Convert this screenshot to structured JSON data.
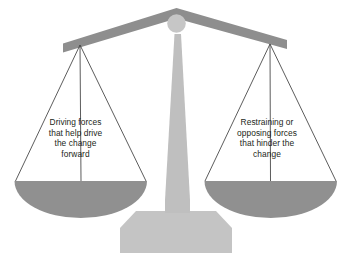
{
  "diagram": {
    "colors": {
      "background": "#ffffff",
      "beam": "#8e8e8e",
      "pan": "#909090",
      "knob": "#c6c6c6",
      "stem": "#bfbfbf",
      "base": "#c4c4c4",
      "string": "#4a4a4a",
      "text": "#231f20"
    },
    "left_pan": {
      "label": "Driving forces\nthat help drive\nthe change\nforward",
      "lines": [
        "Driving forces",
        "that help drive",
        "the change",
        "forward"
      ]
    },
    "right_pan": {
      "label": "Restraining or\nopposing forces\nthat hinder the\nchange",
      "lines": [
        "Restraining or",
        "opposing forces",
        "that hinder the",
        "change"
      ]
    }
  }
}
